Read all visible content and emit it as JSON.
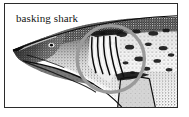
{
  "figure": {
    "kind": "engraved-natural-history-illustration",
    "subject_label": "basking shark",
    "border_color": "#2b2b2b",
    "background_color": "#ffffff",
    "ink_color": "#111111",
    "frame": {
      "x": 4,
      "y": 3,
      "width": 174,
      "height": 105,
      "border_width": 1
    }
  },
  "label": {
    "text": "basking shark",
    "color": "#141414",
    "font_size_px": 11,
    "x": 11,
    "y": 8
  },
  "annotation": {
    "name": "gill-slit-highlight-circle",
    "shape": "circle",
    "color": "#9a9a9a",
    "stroke_width": 3.5,
    "center_x": 107,
    "center_y": 56,
    "radius": 34
  },
  "anatomy": {
    "parts": [
      "snout",
      "upper-jaw",
      "lower-jaw",
      "eye",
      "gill-slits",
      "dorsal-surface",
      "ventral-surface",
      "pectoral-fin",
      "body"
    ],
    "gill_slit_count": 5,
    "orientation": "head-left-body-right"
  },
  "tones": {
    "dark_ink": "#101010",
    "mid_tone": "#6f6f6f",
    "light_tone": "#c8c8c8",
    "paper": "#ffffff"
  }
}
